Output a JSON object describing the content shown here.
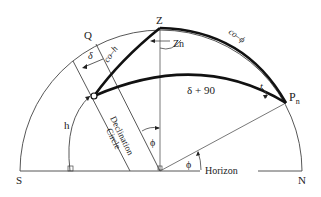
{
  "diagram": {
    "points": {
      "zenith": "Z",
      "pole": "P",
      "pole_subscript": "n",
      "q": "Q",
      "south": "S",
      "north": "N"
    },
    "labels": {
      "co_h": "co–h",
      "co_phi": "co–ϕ",
      "zn": "Zn",
      "delta_plus_90": "δ + 90",
      "t": "t",
      "delta": "δ",
      "h": "h",
      "phi_vertical": "ϕ",
      "phi_horizon": "ϕ",
      "declination_circle_line1": "Declination",
      "declination_circle_line2": "Circle",
      "horizon": "Horizon"
    },
    "colors": {
      "line": "#333333",
      "thick_line": "#111111",
      "background": "#ffffff"
    }
  }
}
